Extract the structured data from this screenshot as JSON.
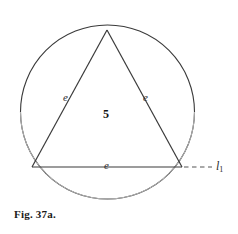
{
  "figure": {
    "caption": "Fig. 37a.",
    "stroke_color": "#3a3a3a",
    "arc_light_color": "#9a9a9a",
    "background_color": "#ffffff",
    "geometry": {
      "circle": {
        "cx": 107.5,
        "cy": 112,
        "r": 87
      },
      "triangle": {
        "apex": {
          "x": 107,
          "y": 30
        },
        "bottom_left": {
          "x": 32,
          "y": 167
        },
        "bottom_right": {
          "x": 182,
          "y": 167
        }
      },
      "line_l1": {
        "x1": 182,
        "y1": 167,
        "x2": 214,
        "y2": 167,
        "dashed": true
      }
    },
    "labels": {
      "left_side": "e",
      "right_side": "e",
      "bottom_side": "e",
      "center": "5",
      "ray_line": "l",
      "ray_line_subscript": "1"
    }
  }
}
